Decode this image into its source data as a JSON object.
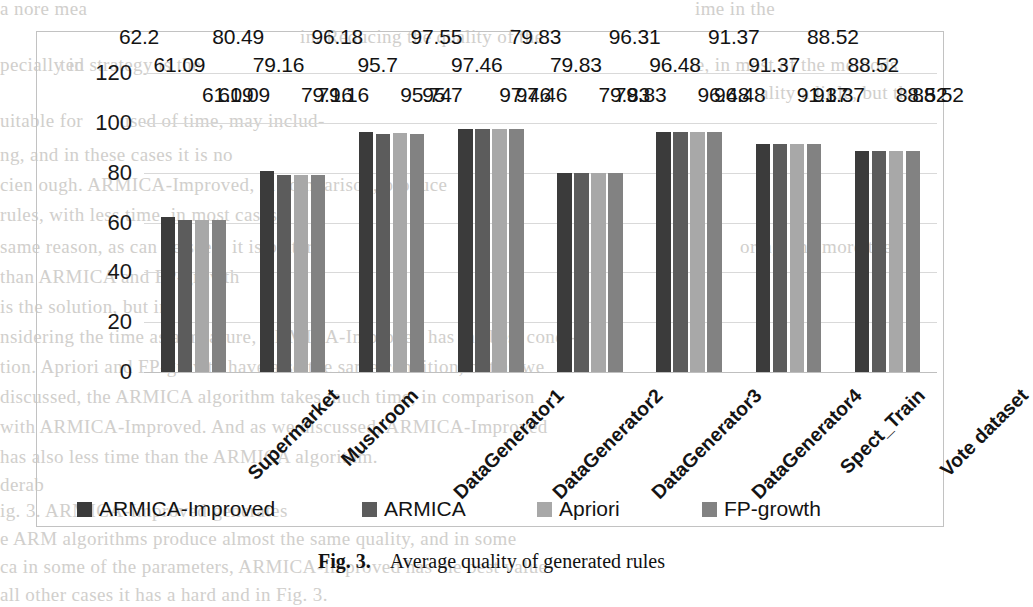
{
  "figure": {
    "caption_number": "Fig. 3.",
    "caption_text": "Average quality of generated rules"
  },
  "chart_data": {
    "type": "bar",
    "title": "",
    "xlabel": "",
    "ylabel": "",
    "ylim": [
      0,
      120
    ],
    "yticks": [
      0,
      20,
      40,
      60,
      80,
      100,
      120
    ],
    "grid": true,
    "legend_position": "bottom",
    "categories": [
      "Supermarket",
      "Mushroom",
      "DataGenerator1",
      "DataGenerator2",
      "DataGenerator3",
      "DataGenerator4",
      "Spect_Train",
      "Vote dataset"
    ],
    "series": [
      {
        "name": "ARMICA-Improved",
        "color": "#3b3b3b",
        "values": [
          62.2,
          80.49,
          96.18,
          97.55,
          79.83,
          96.31,
          91.37,
          88.52
        ]
      },
      {
        "name": "ARMICA",
        "color": "#5c5c5c",
        "values": [
          61.09,
          79.16,
          95.7,
          97.46,
          79.83,
          96.48,
          91.37,
          88.52
        ]
      },
      {
        "name": "Apriori",
        "color": "#a8a8a8",
        "values": [
          61.09,
          79.16,
          95.74,
          97.46,
          79.83,
          96.48,
          91.37,
          88.52
        ]
      },
      {
        "name": "FP-growth",
        "color": "#828282",
        "values": [
          61.09,
          79.16,
          95.7,
          97.46,
          79.83,
          96.48,
          91.37,
          88.52
        ]
      }
    ],
    "data_labels": [
      [
        "62.2",
        "61.09",
        "61.09",
        "61.09"
      ],
      [
        "80.49",
        "79.16",
        "79.16",
        "79.16"
      ],
      [
        "96.18",
        "95.7",
        "95.74",
        "95.7"
      ],
      [
        "97.55",
        "97.46",
        "97.46",
        "97.46"
      ],
      [
        "79.83",
        "79.83",
        "79.83",
        "79.83"
      ],
      [
        "96.31",
        "96.48",
        "96.48",
        "96.48"
      ],
      [
        "91.37",
        "91.37",
        "91.37",
        "91.37"
      ],
      [
        "88.52",
        "88.52",
        "88.52",
        "88.52"
      ]
    ]
  },
  "bleed_text": [
    "a nore mea",
    "ime in the",
    "in. Reducing the quality of the",
    "pecially in",
    "ted strategy is the",
    "te, in most of the methods",
    "ality a little, but the",
    "uitable for",
    "used of time, may includ-",
    "ng, and in these cases it is no",
    "cien   ough. ARMICA-Improved, in comparison, produce",
    "rules, with less time, in most cases.",
    "same reason, as can be seen, it is better",
    "than ARMICA and FP-growth",
    "oring, the more the",
    "is the solution, but in",
    "nsidering the time as a measure, ARMICA-Improved has the best condi-",
    "tion. Apriori and FP-growth have also the same condition, but as we",
    "discussed, the ARMICA algorithm takes much time, in comparison",
    "with ARMICA-Improved. And as we discussed, ARMICA-Improved",
    "has also less time than the ARMICA algorithm.",
    "derab",
    "ig. 3. ARMICA-Improved generates",
    "e  ARM algorithms produce almost the same quality, and in some",
    "ca   in some of the parameters, ARMICA-Improved has the best value",
    "all  other cases it has a hard  and in Fig. 3."
  ]
}
